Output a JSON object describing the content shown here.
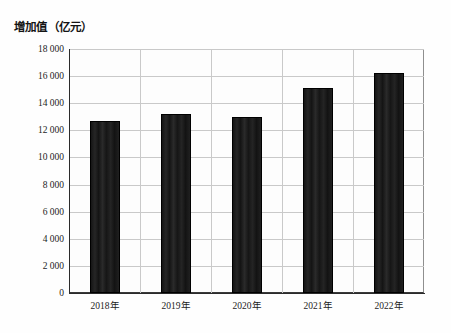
{
  "chart_data": {
    "type": "bar",
    "title": "增加值（亿元）",
    "xlabel": "",
    "ylabel": "增加值（亿元）",
    "categories": [
      "2018年",
      "2019年",
      "2020年",
      "2021年",
      "2022年"
    ],
    "values": [
      12700,
      13200,
      13000,
      15100,
      16200
    ],
    "ylim": [
      0,
      18000
    ],
    "yticks": [
      0,
      2000,
      4000,
      6000,
      8000,
      10000,
      12000,
      14000,
      16000,
      18000
    ],
    "ytick_labels": [
      "0",
      "2 000",
      "4 000",
      "6 000",
      "8 000",
      "10 000",
      "12 000",
      "14 000",
      "16 000",
      "18 000"
    ],
    "grid": "horizontal-and-vertical",
    "legend": "none",
    "bar_color": "#1b1b1b",
    "grid_color": "#c9c9c9",
    "axis_color": "#2b2b2b",
    "background_color": "#fdfdfd"
  }
}
